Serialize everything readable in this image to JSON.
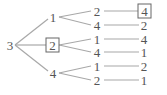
{
  "diagram": {
    "type": "tree",
    "line_color": "#a8a8a8",
    "text_color": "#555555",
    "root": {
      "label": "3",
      "boxed": false,
      "children": [
        {
          "label": "1",
          "boxed": false,
          "children": [
            {
              "label": "2",
              "boxed": false,
              "children": [
                {
                  "label": "4",
                  "boxed": true
                }
              ]
            },
            {
              "label": "4",
              "boxed": false,
              "children": [
                {
                  "label": "2",
                  "boxed": false
                }
              ]
            }
          ]
        },
        {
          "label": "2",
          "boxed": true,
          "children": [
            {
              "label": "1",
              "boxed": false,
              "children": [
                {
                  "label": "4",
                  "boxed": false
                }
              ]
            },
            {
              "label": "4",
              "boxed": false,
              "children": [
                {
                  "label": "1",
                  "boxed": false
                }
              ]
            }
          ]
        },
        {
          "label": "4",
          "boxed": false,
          "children": [
            {
              "label": "1",
              "boxed": false,
              "children": [
                {
                  "label": "2",
                  "boxed": false
                }
              ]
            },
            {
              "label": "2",
              "boxed": false,
              "children": [
                {
                  "label": "1",
                  "boxed": false
                }
              ]
            }
          ]
        }
      ]
    }
  }
}
